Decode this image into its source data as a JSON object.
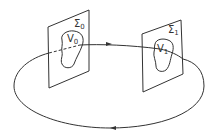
{
  "diagram": {
    "type": "flow-loop-through-sections",
    "colors": {
      "stroke": "#333333",
      "background": "#ffffff"
    },
    "sections": [
      {
        "id": "sigma0",
        "label_base": "Σ",
        "label_sub": "0",
        "region": {
          "label_base": "V",
          "label_sub": "0"
        }
      },
      {
        "id": "sigma1",
        "label_base": "Σ",
        "label_sub": "1",
        "region": {
          "label_base": "V",
          "label_sub": "1"
        }
      }
    ],
    "arrows": [
      {
        "position": "top",
        "direction": "right"
      },
      {
        "position": "bottom",
        "direction": "left"
      }
    ]
  }
}
